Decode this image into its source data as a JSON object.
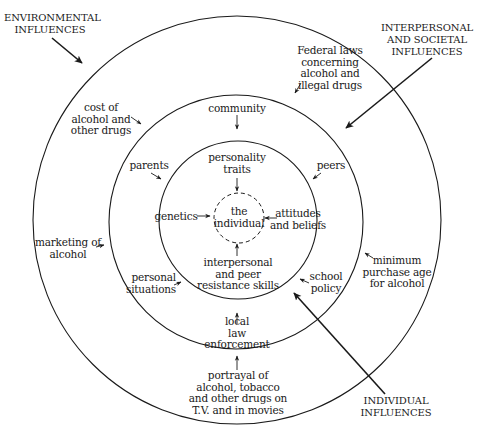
{
  "diagram": {
    "type": "concentric-influence-model",
    "colors": {
      "stroke": "#1a1a1a",
      "background": "#ffffff",
      "text": "#1a1a1a"
    },
    "rings": [
      {
        "name": "outer-ring",
        "represents": "ENVIRONMENTAL INFLUENCES",
        "cx": 237,
        "cy": 220,
        "r": 204
      },
      {
        "name": "middle-ring",
        "represents": "INTERPERSONAL AND SOCIETAL INFLUENCES",
        "cx": 236,
        "cy": 222,
        "r": 127
      },
      {
        "name": "inner-ring",
        "represents": "INDIVIDUAL INFLUENCES",
        "cx": 238,
        "cy": 220,
        "r": 79
      },
      {
        "name": "core-dashed",
        "represents": "the individual",
        "cx": 239,
        "cy": 218,
        "r": 25,
        "dashed": true
      }
    ],
    "category_labels": {
      "environmental": "ENVIRONMENTAL\nINFLUENCES",
      "interpersonal": "INTERPERSONAL\nAND SOCIETAL\nINFLUENCES",
      "individual": "INDIVIDUAL\nINFLUENCES"
    },
    "center": {
      "label": "the\nindividual"
    },
    "individual_factors": {
      "personality": "personality\ntraits",
      "genetics": "genetics",
      "attitudes": "attitudes\nand beliefs",
      "resistance": "interpersonal\nand peer\nresistance skills"
    },
    "interpersonal_factors": {
      "community": "community",
      "parents": "parents",
      "peers": "peers",
      "personal_situations": "personal\nsituations",
      "school_policy": "school\npolicy",
      "local_law": "local\nlaw\nenforcement"
    },
    "environmental_factors": {
      "federal_laws": "Federal laws\nconcerning\nalcohol and\nillegal drugs",
      "cost": "cost of\nalcohol and\nother drugs",
      "marketing": "marketing of\nalcohol",
      "minimum_age": "minimum\npurchase age\nfor alcohol",
      "portrayal": "portrayal of\nalcohol, tobacco\nand other drugs on\nT.V. and in movies"
    }
  }
}
